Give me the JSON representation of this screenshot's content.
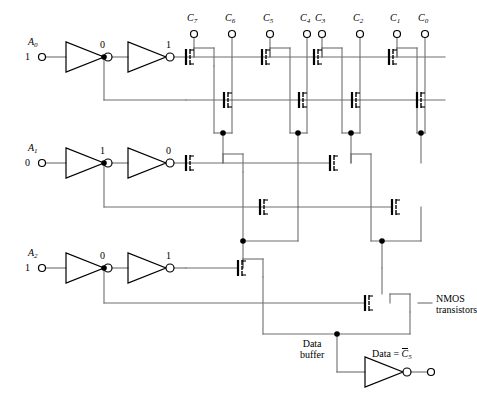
{
  "diagram": {
    "line_color": "#6e6e6e",
    "ink_color": "#000000"
  },
  "inputs": [
    {
      "name": "A0",
      "label": "A",
      "sub": "0",
      "value": "1",
      "inv1_out": "0",
      "inv2_out": "1"
    },
    {
      "name": "A1",
      "label": "A",
      "sub": "1",
      "value": "0",
      "inv1_out": "1",
      "inv2_out": "0"
    },
    {
      "name": "A2",
      "label": "A",
      "sub": "2",
      "value": "1",
      "inv1_out": "0",
      "inv2_out": "1"
    }
  ],
  "column_terminals": [
    {
      "label": "C",
      "sub": "7"
    },
    {
      "label": "C",
      "sub": "6"
    },
    {
      "label": "C",
      "sub": "5"
    },
    {
      "label": "C",
      "sub": "4"
    },
    {
      "label": "C",
      "sub": "3"
    },
    {
      "label": "C",
      "sub": "2"
    },
    {
      "label": "C",
      "sub": "1"
    },
    {
      "label": "C",
      "sub": "0"
    }
  ],
  "annotations": {
    "nmos_note_line1": "NMOS",
    "nmos_note_line2": "transistors",
    "data_buffer_line1": "Data",
    "data_buffer_line2": "buffer"
  },
  "output": {
    "prefix": "Data = ",
    "signal": "C",
    "sub": "5",
    "overbar": true
  }
}
